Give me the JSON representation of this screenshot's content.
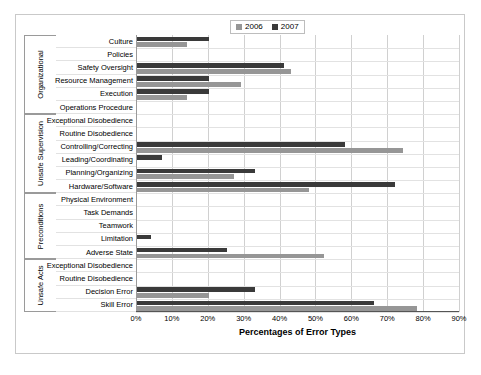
{
  "legend": {
    "entries": [
      {
        "label": "2006",
        "color": "#969696"
      },
      {
        "label": "2007",
        "color": "#3a3a3a"
      }
    ]
  },
  "chart_data": {
    "type": "bar",
    "orientation": "horizontal",
    "title": "",
    "xlabel": "Percentages of Error Types",
    "ylabel": "",
    "xlim": [
      0,
      90
    ],
    "xticks": [
      "0%",
      "10%",
      "20%",
      "30%",
      "40%",
      "50%",
      "60%",
      "70%",
      "80%",
      "90%"
    ],
    "xtick_values": [
      0,
      10,
      20,
      30,
      40,
      50,
      60,
      70,
      80,
      90
    ],
    "grid": true,
    "legend_position": "top-right",
    "groups": [
      {
        "name": "Organizational",
        "count": 6
      },
      {
        "name": "Unsafe Supervision",
        "count": 6
      },
      {
        "name": "Preconditions",
        "count": 5
      },
      {
        "name": "Unsafe Acts",
        "count": 4
      }
    ],
    "categories": [
      "Culture",
      "Policies",
      "Safety Oversight",
      "Resource Management",
      "Execution",
      "Operations Procedure",
      "Exceptional Disobedience",
      "Routine Disobedience",
      "Controlling/Correcting",
      "Leading/Coordinating",
      "Planning/Organizing",
      "Hardware/Software",
      "Physical Environment",
      "Task Demands",
      "Teamwork",
      "Limitation",
      "Adverse State",
      "Exceptional Disobedience",
      "Routine Disobedience",
      "Decision Error",
      "Skill Error"
    ],
    "series": [
      {
        "name": "2006",
        "color": "#969696",
        "values": [
          14,
          0,
          43,
          29,
          14,
          0,
          0,
          0,
          74,
          0,
          27,
          48,
          0,
          0,
          0,
          0,
          52,
          0,
          0,
          20,
          78
        ]
      },
      {
        "name": "2007",
        "color": "#3a3a3a",
        "values": [
          20,
          0,
          41,
          20,
          20,
          0,
          0,
          0,
          58,
          7,
          33,
          72,
          0,
          0,
          0,
          4,
          25,
          0,
          0,
          33,
          66
        ]
      }
    ]
  }
}
